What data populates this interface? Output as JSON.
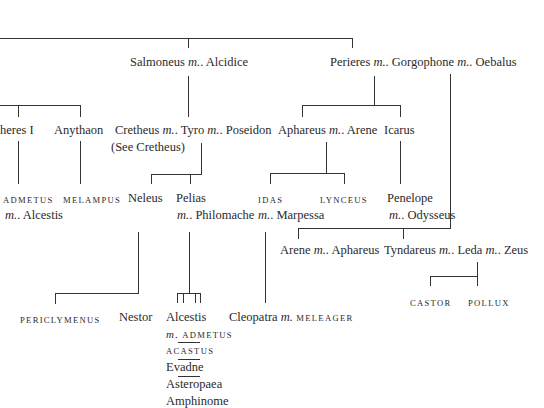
{
  "nodes": {
    "salmoneus": {
      "name": "Salmoneus",
      "m": "m.",
      "spouse": ". Alcidice"
    },
    "perieres": {
      "name": "Perieres",
      "m": "m.",
      "spouse1": ". Gorgophone",
      "spouse2": ". Oebalus"
    },
    "pheres": {
      "name": "Pheres I"
    },
    "anythaon": {
      "name": "Anythaon"
    },
    "cretheus": {
      "name": "Cretheus",
      "m": "m.",
      "spouse1": ". Tyro",
      "spouse2": ". Poseidon",
      "note": "(See Cretheus)"
    },
    "aphareus": {
      "name": "Aphareus",
      "m": "m.",
      "spouse": ". Arene"
    },
    "icarus": {
      "name": "Icarus"
    },
    "admetus": {
      "name": "admetus",
      "m": "m.",
      "spouse": ". Alcestis"
    },
    "melampus": {
      "name": "melampus"
    },
    "neleus": {
      "name": "Neleus"
    },
    "pelias": {
      "name": "Pelias",
      "m": "m.",
      "spouse": ". Philomache"
    },
    "idas": {
      "name": "idas",
      "m": "m.",
      "spouse": ". Marpessa"
    },
    "lynceus": {
      "name": "lynceus"
    },
    "penelope": {
      "name": "Penelope",
      "m": "m.",
      "spouse": ". Odysseus"
    },
    "arene": {
      "name": "Arene",
      "m": "m.",
      "spouse": ". Aphareus"
    },
    "tyndareus": {
      "name": "Tyndareus",
      "m": "m.",
      "spouse1": ". Leda",
      "spouse2": ". Zeus"
    },
    "castor": {
      "name": "castor"
    },
    "pollux": {
      "name": "pollux"
    },
    "periclymenus": {
      "name": "periclymenus"
    },
    "nestor": {
      "name": "Nestor"
    },
    "alcestis": {
      "name": "Alcestis",
      "m": "m.",
      "spouse": " admetus"
    },
    "acastus": {
      "name": "acastus"
    },
    "evadne": {
      "name": "Evadne"
    },
    "asteropaea": {
      "name": "Asteropaea"
    },
    "amphinome": {
      "name": "Amphinome"
    },
    "cleopatra": {
      "name": "Cleopatra",
      "m": "m.",
      "spouse": " meleager"
    }
  }
}
